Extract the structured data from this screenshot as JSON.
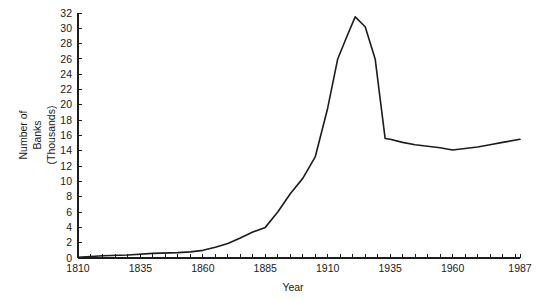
{
  "chart_data": {
    "type": "line",
    "title": "",
    "xlabel": "Year",
    "ylabel": "Number of Banks (Thousands)",
    "ylabel_lines": [
      "Number of",
      "Banks",
      "(Thousands)"
    ],
    "xlim": [
      1810,
      1987
    ],
    "ylim": [
      0,
      32
    ],
    "grid": false,
    "legend": null,
    "x_tick_labels": [
      "1810",
      "1835",
      "1860",
      "1885",
      "1910",
      "1935",
      "1960",
      "1987"
    ],
    "x_tick_values": [
      1810,
      1835,
      1860,
      1885,
      1910,
      1935,
      1960,
      1987
    ],
    "x_minor_step": 5,
    "y_tick_labels": [
      "0",
      "2",
      "4",
      "6",
      "8",
      "10",
      "12",
      "14",
      "16",
      "18",
      "20",
      "22",
      "24",
      "26",
      "28",
      "30",
      "32"
    ],
    "y_tick_values": [
      0,
      2,
      4,
      6,
      8,
      10,
      12,
      14,
      16,
      18,
      20,
      22,
      24,
      26,
      28,
      30,
      32
    ],
    "series": [
      {
        "name": "Number of Banks",
        "color": "#1c1c1c",
        "x": [
          1810,
          1820,
          1830,
          1840,
          1850,
          1855,
          1860,
          1865,
          1870,
          1875,
          1880,
          1885,
          1890,
          1895,
          1900,
          1905,
          1910,
          1914,
          1918,
          1921,
          1925,
          1929,
          1933,
          1935,
          1940,
          1945,
          1950,
          1955,
          1960,
          1965,
          1970,
          1975,
          1980,
          1987
        ],
        "y": [
          0.1,
          0.3,
          0.4,
          0.6,
          0.7,
          0.8,
          1.0,
          1.4,
          1.9,
          2.6,
          3.4,
          4.0,
          6.0,
          8.4,
          10.4,
          13.2,
          19.6,
          26.0,
          29.2,
          31.5,
          30.2,
          26.0,
          15.6,
          15.5,
          15.1,
          14.8,
          14.6,
          14.4,
          14.1,
          14.3,
          14.5,
          14.8,
          15.1,
          15.5
        ]
      }
    ]
  },
  "figure": {
    "background_color": "#ffffff",
    "line_color": "#1c1c1c",
    "axis_color": "#1d1d1d"
  }
}
